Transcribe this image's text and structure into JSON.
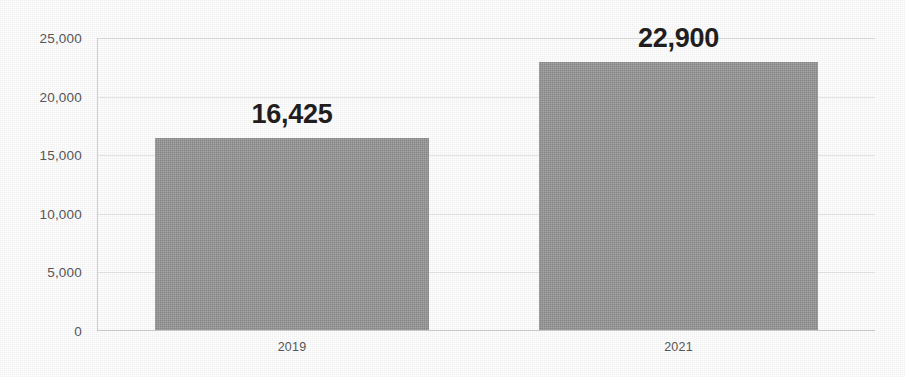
{
  "chart_data": {
    "type": "bar",
    "title": "",
    "subtitle": "",
    "xlabel": "",
    "ylabel": "",
    "categories": [
      "2019",
      "2021"
    ],
    "values": [
      16425,
      22900
    ],
    "value_labels": [
      "16,425",
      "22,900"
    ],
    "series": [
      {
        "name": "",
        "values": [
          16425,
          22900
        ]
      }
    ],
    "ylim": [
      0,
      25000
    ],
    "ytick_values": [
      25000,
      20000,
      15000,
      10000,
      5000,
      0
    ],
    "ytick_labels": [
      "25,000",
      "20,000",
      "15,000",
      "10,000",
      "5,000",
      "0"
    ],
    "grid": true,
    "grid_axis": "y",
    "legend": false,
    "legend_position": "none",
    "bar_color": "#9c9c9c",
    "label_color": "#231f20",
    "axis_text_color": "#58585a",
    "gridline_color": "#e6e6e6",
    "background_color": "#fefefe",
    "annotations": []
  }
}
